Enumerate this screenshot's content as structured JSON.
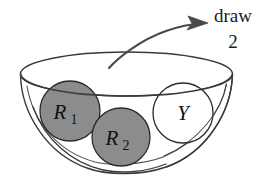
{
  "diagram": {
    "type": "urn-sampling-illustration",
    "container": {
      "name": "bowl",
      "shape": "open bowl drawn in perspective with elliptical rim",
      "fill": "#ffffff",
      "stroke": "#3a3a3a"
    },
    "annotation": {
      "line1": "draw",
      "line2": "2",
      "arrow": {
        "name": "draw-arrow",
        "direction": "up-right",
        "style": "curved arrow with solid arrowhead",
        "color": "#4a4a4a"
      }
    },
    "balls": [
      {
        "id": "r1",
        "label": "R",
        "subscript": "1",
        "color_name": "red",
        "fill": "#8c8c8c",
        "stroke": "#2b2b2b",
        "cx": 70,
        "cy": 111,
        "r": 30
      },
      {
        "id": "r2",
        "label": "R",
        "subscript": "2",
        "color_name": "red",
        "fill": "#8c8c8c",
        "stroke": "#2b2b2b",
        "cx": 121,
        "cy": 137,
        "r": 29
      },
      {
        "id": "y",
        "label": "Y",
        "subscript": "",
        "color_name": "yellow",
        "fill": "#ffffff",
        "stroke": "#2b2b2b",
        "cx": 183,
        "cy": 113,
        "r": 30
      }
    ],
    "colors": {
      "ball_gray": "#8c8c8c",
      "ball_white": "#ffffff",
      "outline": "#3a3a3a",
      "arrow": "#4a4a4a",
      "text": "#1a1a1a",
      "background": "#ffffff"
    }
  }
}
